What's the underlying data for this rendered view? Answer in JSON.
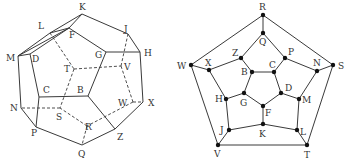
{
  "left_diagram": {
    "title": "Dodecahedron (3D perspective)",
    "vertices": {
      "K": [
        82,
        14
      ],
      "L": [
        50,
        33
      ],
      "F": [
        69,
        28
      ],
      "J": [
        128,
        34
      ],
      "H": [
        140,
        52
      ],
      "G": [
        106,
        52
      ],
      "M": [
        18,
        56
      ],
      "D": [
        30,
        54
      ],
      "T": [
        74,
        69
      ],
      "V": [
        121,
        66
      ],
      "C": [
        39,
        97
      ],
      "B": [
        88,
        96
      ],
      "N": [
        21,
        108
      ],
      "S": [
        60,
        108
      ],
      "W": [
        133,
        102
      ],
      "X": [
        143,
        102
      ],
      "P": [
        36,
        127
      ],
      "R": [
        87,
        126
      ],
      "Z": [
        115,
        129
      ],
      "Q": [
        82,
        145
      ]
    },
    "labels": [
      {
        "t": "K",
        "x": 79,
        "y": 10
      },
      {
        "t": "L",
        "x": 38,
        "y": 29
      },
      {
        "t": "F",
        "x": 69,
        "y": 38
      },
      {
        "t": "J",
        "x": 124,
        "y": 32
      },
      {
        "t": "H",
        "x": 144,
        "y": 56
      },
      {
        "t": "G",
        "x": 95,
        "y": 58
      },
      {
        "t": "M",
        "x": 6,
        "y": 61
      },
      {
        "t": "D",
        "x": 32,
        "y": 62
      },
      {
        "t": "T",
        "x": 64,
        "y": 72
      },
      {
        "t": "V",
        "x": 124,
        "y": 70
      },
      {
        "t": "C",
        "x": 43,
        "y": 93
      },
      {
        "t": "B",
        "x": 77,
        "y": 93
      },
      {
        "t": "N",
        "x": 10,
        "y": 111
      },
      {
        "t": "S",
        "x": 56,
        "y": 120
      },
      {
        "t": "W",
        "x": 118,
        "y": 106
      },
      {
        "t": "X",
        "x": 148,
        "y": 106
      },
      {
        "t": "P",
        "x": 31,
        "y": 136
      },
      {
        "t": "R",
        "x": 85,
        "y": 130
      },
      {
        "t": "Z",
        "x": 117,
        "y": 140
      },
      {
        "t": "Q",
        "x": 78,
        "y": 157
      }
    ],
    "visible_edges": [
      [
        "K",
        "J"
      ],
      [
        "J",
        "H"
      ],
      [
        "H",
        "X"
      ],
      [
        "X",
        "Z"
      ],
      [
        "Z",
        "Q"
      ],
      [
        "Q",
        "P"
      ],
      [
        "P",
        "N"
      ],
      [
        "N",
        "M"
      ],
      [
        "M",
        "L"
      ],
      [
        "L",
        "K"
      ],
      [
        "K",
        "F"
      ],
      [
        "F",
        "G"
      ],
      [
        "G",
        "B"
      ],
      [
        "B",
        "C"
      ],
      [
        "C",
        "D"
      ],
      [
        "D",
        "F"
      ],
      [
        "F",
        "L"
      ],
      [
        "G",
        "H"
      ],
      [
        "B",
        "Z"
      ],
      [
        "C",
        "P"
      ],
      [
        "D",
        "M"
      ],
      [
        "M",
        "F"
      ]
    ],
    "hidden_edges": [
      [
        "L",
        "T"
      ],
      [
        "T",
        "V"
      ],
      [
        "T",
        "S"
      ],
      [
        "V",
        "J"
      ],
      [
        "V",
        "W"
      ],
      [
        "W",
        "X"
      ],
      [
        "W",
        "R"
      ],
      [
        "R",
        "S"
      ],
      [
        "S",
        "N"
      ],
      [
        "R",
        "Q"
      ]
    ]
  },
  "right_diagram": {
    "title": "Schlegel diagram of dodecahedron",
    "vertices": {
      "R": [
        263,
        15
      ],
      "Q": [
        263,
        33
      ],
      "Z": [
        241,
        58
      ],
      "P": [
        285,
        58
      ],
      "X": [
        209,
        70
      ],
      "W": [
        191,
        65
      ],
      "N": [
        317,
        71
      ],
      "S": [
        333,
        65
      ],
      "B": [
        252,
        72
      ],
      "C": [
        274,
        72
      ],
      "D": [
        281,
        93
      ],
      "G": [
        244,
        93
      ],
      "M": [
        299,
        99
      ],
      "H": [
        226,
        99
      ],
      "F": [
        263,
        106
      ],
      "K": [
        263,
        124
      ],
      "J": [
        229,
        130
      ],
      "L": [
        297,
        130
      ],
      "V": [
        218,
        145
      ],
      "T": [
        307,
        145
      ]
    },
    "labels": [
      {
        "t": "R",
        "x": 259,
        "y": 10
      },
      {
        "t": "Q",
        "x": 259,
        "y": 45
      },
      {
        "t": "Z",
        "x": 232,
        "y": 56
      },
      {
        "t": "P",
        "x": 288,
        "y": 55
      },
      {
        "t": "X",
        "x": 205,
        "y": 66
      },
      {
        "t": "W",
        "x": 177,
        "y": 69
      },
      {
        "t": "N",
        "x": 313,
        "y": 66
      },
      {
        "t": "S",
        "x": 338,
        "y": 69
      },
      {
        "t": "B",
        "x": 241,
        "y": 75
      },
      {
        "t": "C",
        "x": 269,
        "y": 68
      },
      {
        "t": "D",
        "x": 285,
        "y": 91
      },
      {
        "t": "G",
        "x": 240,
        "y": 106
      },
      {
        "t": "M",
        "x": 302,
        "y": 103
      },
      {
        "t": "H",
        "x": 215,
        "y": 102
      },
      {
        "t": "F",
        "x": 265,
        "y": 116
      },
      {
        "t": "K",
        "x": 259,
        "y": 137
      },
      {
        "t": "J",
        "x": 220,
        "y": 133
      },
      {
        "t": "L",
        "x": 300,
        "y": 135
      },
      {
        "t": "V",
        "x": 214,
        "y": 157
      },
      {
        "t": "T",
        "x": 304,
        "y": 158
      }
    ],
    "edges": [
      [
        "R",
        "Q"
      ],
      [
        "R",
        "W"
      ],
      [
        "R",
        "S"
      ],
      [
        "W",
        "V"
      ],
      [
        "S",
        "T"
      ],
      [
        "V",
        "T"
      ],
      [
        "Q",
        "Z"
      ],
      [
        "Q",
        "P"
      ],
      [
        "Z",
        "X"
      ],
      [
        "Z",
        "B"
      ],
      [
        "P",
        "C"
      ],
      [
        "P",
        "N"
      ],
      [
        "X",
        "W"
      ],
      [
        "N",
        "S"
      ],
      [
        "X",
        "H"
      ],
      [
        "N",
        "M"
      ],
      [
        "B",
        "C"
      ],
      [
        "C",
        "D"
      ],
      [
        "D",
        "F"
      ],
      [
        "F",
        "G"
      ],
      [
        "G",
        "B"
      ],
      [
        "G",
        "H"
      ],
      [
        "D",
        "M"
      ],
      [
        "F",
        "K"
      ],
      [
        "H",
        "J"
      ],
      [
        "M",
        "L"
      ],
      [
        "J",
        "K"
      ],
      [
        "K",
        "L"
      ],
      [
        "J",
        "V"
      ],
      [
        "L",
        "T"
      ]
    ]
  }
}
